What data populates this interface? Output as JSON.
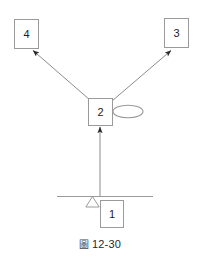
{
  "figure": {
    "caption_cjk": "圖",
    "caption_number": "12-30",
    "caption_full": "圖 12-30"
  },
  "colors": {
    "stroke": "#9a9a9a",
    "arrow": "#8c8c8c",
    "arrow_head": "#2b2b2b",
    "text": "#1c1c1c",
    "background": "#ffffff"
  },
  "diagram": {
    "type": "block-diagram",
    "nodes": [
      {
        "id": "node-4",
        "label": "4",
        "x": 14,
        "y": 19,
        "w": 25,
        "h": 30,
        "shape": "rectangle"
      },
      {
        "id": "node-3",
        "label": "3",
        "x": 164,
        "y": 18,
        "w": 25,
        "h": 30,
        "shape": "rectangle"
      },
      {
        "id": "node-2",
        "label": "2",
        "x": 88,
        "y": 98,
        "w": 25,
        "h": 28,
        "shape": "rectangle"
      },
      {
        "id": "node-1",
        "label": "1",
        "x": 100,
        "y": 200,
        "w": 24,
        "h": 28,
        "shape": "rectangle"
      }
    ],
    "ellipse": {
      "id": "ellipse-marker",
      "cx": 128,
      "cy": 111.5,
      "rx": 15,
      "ry": 6.5
    },
    "triangle": {
      "id": "triangle-marker",
      "x1": 86,
      "y1": 207,
      "x2": 99,
      "y2": 207,
      "apex_x": 92.5,
      "apex_y": 196
    },
    "ground_line": {
      "id": "ground-line",
      "x1": 57,
      "y1": 196,
      "x2": 153,
      "y2": 196
    },
    "arrows": [
      {
        "id": "arrow-2-to-4",
        "from": "node-2",
        "to": "node-4",
        "x1": 90,
        "y1": 100,
        "x2": 32,
        "y2": 50
      },
      {
        "id": "arrow-2-to-3",
        "from": "node-2",
        "to": "node-3",
        "x1": 112,
        "y1": 101,
        "x2": 172,
        "y2": 50
      },
      {
        "id": "arrow-ground-to-2",
        "from": "ground-line",
        "to": "node-2",
        "x1": 100,
        "y1": 196,
        "x2": 100,
        "y2": 126
      }
    ]
  }
}
